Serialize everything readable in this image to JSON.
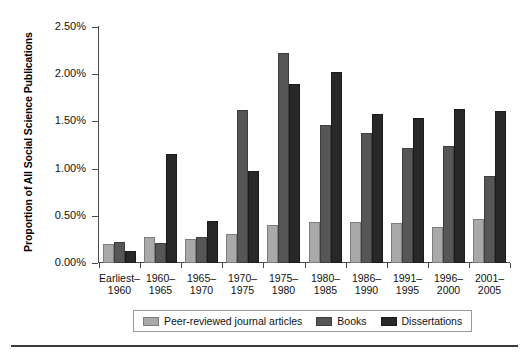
{
  "chart_data": {
    "type": "bar",
    "title": "",
    "subtitle": "",
    "xlabel": "",
    "ylabel": "Proportion of All Social Science Publications",
    "ylim": [
      0,
      2.5
    ],
    "ytick_values": [
      2.5,
      2.0,
      1.5,
      1.0,
      0.5,
      0.0
    ],
    "ytick_labels": [
      "2.50%",
      "2.00%",
      "1.50%",
      "1.00%",
      "0.50%",
      "0.00%"
    ],
    "grid": false,
    "legend_position": "bottom-center",
    "value_unit": "%",
    "categories": [
      "Earliest–1960",
      "1960–1965",
      "1965–1970",
      "1970–1975",
      "1975–1980",
      "1980–1985",
      "1986–1990",
      "1991–1995",
      "1996–2000",
      "2001–2005"
    ],
    "category_lines": [
      [
        "Earliest–",
        "1960"
      ],
      [
        "1960–",
        "1965"
      ],
      [
        "1965–",
        "1970"
      ],
      [
        "1970–",
        "1975"
      ],
      [
        "1975–",
        "1980"
      ],
      [
        "1980–",
        "1985"
      ],
      [
        "1986–",
        "1990"
      ],
      [
        "1991–",
        "1995"
      ],
      [
        "1996–",
        "2000"
      ],
      [
        "2001–",
        "2005"
      ]
    ],
    "series": [
      {
        "name": "Peer-reviewed journal articles",
        "color": "#a9a9a9",
        "values": [
          0.2,
          0.28,
          0.25,
          0.31,
          0.4,
          0.43,
          0.43,
          0.42,
          0.38,
          0.47
        ]
      },
      {
        "name": "Books",
        "color": "#565656",
        "values": [
          0.22,
          0.21,
          0.28,
          1.62,
          2.22,
          1.46,
          1.38,
          1.22,
          1.24,
          0.92
        ]
      },
      {
        "name": "Dissertations",
        "color": "#282828",
        "values": [
          0.13,
          1.15,
          0.45,
          0.97,
          1.9,
          2.02,
          1.58,
          1.54,
          1.63,
          1.61
        ]
      }
    ]
  },
  "legend": {
    "entries": [
      "Peer-reviewed journal articles",
      "Books",
      "Dissertations"
    ]
  }
}
